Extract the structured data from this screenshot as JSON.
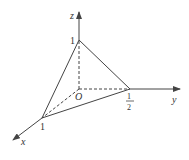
{
  "diagram": {
    "type": "3d-coordinate-tetrahedron",
    "axes": {
      "x": {
        "label": "x"
      },
      "y": {
        "label": "y"
      },
      "z": {
        "label": "z"
      }
    },
    "origin_label": "O",
    "points": {
      "x_intercept": {
        "label": "1"
      },
      "y_intercept": {
        "numerator": "1",
        "denominator": "2"
      },
      "z_intercept": {
        "label": "1"
      }
    },
    "colors": {
      "line": "#444444",
      "text": "#333333"
    }
  }
}
